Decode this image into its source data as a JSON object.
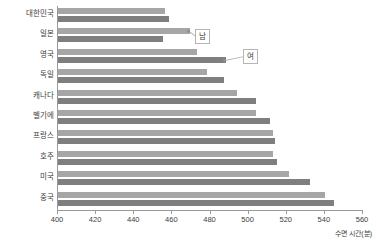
{
  "chart_data": {
    "type": "bar",
    "orientation": "horizontal",
    "title": "",
    "subtitle": "",
    "xlabel": "수면 시간(분)",
    "ylabel": "",
    "xlim": [
      400,
      560
    ],
    "xticks": [
      400,
      420,
      440,
      460,
      480,
      500,
      520,
      540,
      560
    ],
    "grid": false,
    "legend": "annotated-callouts",
    "categories": [
      "대한민국",
      "일본",
      "영국",
      "독일",
      "캐나다",
      "벨기에",
      "프랑스",
      "호주",
      "미국",
      "중국"
    ],
    "series": [
      {
        "name": "남",
        "color": "#a6a6a6",
        "values": [
          456,
          469,
          473,
          478,
          494,
          504,
          513,
          513,
          521,
          540
        ]
      },
      {
        "name": "여",
        "color": "#7f7f7f",
        "values": [
          458,
          455,
          488,
          487,
          504,
          511,
          514,
          515,
          532,
          545
        ]
      }
    ],
    "annotations": [
      {
        "label": "남",
        "series": "남",
        "category": "일본"
      },
      {
        "label": "여",
        "series": "여",
        "category": "영국"
      }
    ]
  },
  "axis": {
    "x_tick_labels": [
      "400",
      "420",
      "440",
      "460",
      "480",
      "500",
      "520",
      "540",
      "560"
    ],
    "x_title": "수면 시간(분)"
  },
  "colors": {
    "male_bar": "#a6a6a6",
    "female_bar": "#7f7f7f",
    "axis": "#9a9a9a",
    "text": "#3d3d3d",
    "callout_border": "#b5b5b5",
    "background": "#ffffff"
  }
}
